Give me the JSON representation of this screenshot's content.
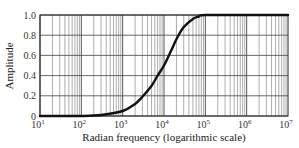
{
  "chart_data": {
    "type": "line",
    "title": "",
    "xlabel": "Radian frequency (logarithmic scale)",
    "ylabel": "Amplitude",
    "xscale": "log",
    "xlim": [
      10,
      10000000
    ],
    "ylim": [
      0,
      1.0
    ],
    "grid": true,
    "legend": null,
    "x_tick_labels": [
      {
        "base": "10",
        "exp": "1"
      },
      {
        "base": "10",
        "exp": "2"
      },
      {
        "base": "10",
        "exp": "3"
      },
      {
        "base": "10",
        "exp": "4"
      },
      {
        "base": "10",
        "exp": "5"
      },
      {
        "base": "10",
        "exp": "6"
      },
      {
        "base": "10",
        "exp": "7"
      }
    ],
    "y_tick_labels": [
      "0",
      "0.2",
      "0.4",
      "0.6",
      "0.8",
      "1.0"
    ],
    "y_ticks": [
      0,
      0.2,
      0.4,
      0.6,
      0.8,
      1.0
    ],
    "series": [
      {
        "name": "Amplitude",
        "x": [
          10,
          100,
          300,
          1000,
          2000,
          3000,
          5000,
          7000,
          10000,
          15000,
          20000,
          30000,
          50000,
          70000,
          100000,
          1000000,
          10000000
        ],
        "values": [
          0.0,
          0.0,
          0.01,
          0.05,
          0.12,
          0.19,
          0.3,
          0.4,
          0.5,
          0.65,
          0.76,
          0.88,
          0.96,
          0.985,
          1.0,
          1.0,
          1.0
        ]
      }
    ]
  }
}
